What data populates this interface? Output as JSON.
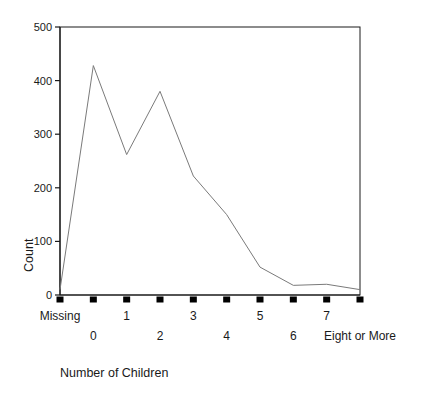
{
  "chart_data": {
    "type": "line",
    "title": "",
    "xlabel": "Number of Children",
    "ylabel": "Count",
    "categories": [
      "Missing",
      "0",
      "1",
      "2",
      "3",
      "4",
      "5",
      "6",
      "7",
      "Eight or More"
    ],
    "values": [
      10,
      428,
      262,
      380,
      222,
      150,
      52,
      18,
      20,
      10
    ],
    "series": [
      {
        "name": "Count",
        "values": [
          10,
          428,
          262,
          380,
          222,
          150,
          52,
          18,
          20,
          10
        ]
      }
    ],
    "ylim": [
      0,
      500
    ],
    "yticks": [
      0,
      100,
      200,
      300,
      400,
      500
    ],
    "ytick_labels": [
      "0",
      "100",
      "200",
      "300",
      "400",
      "500"
    ],
    "grid": false,
    "legend": "none",
    "line_color": "#7a7a7a",
    "axis_color": "#1a1a1a",
    "marker_color": "#000000",
    "background_color": "#ffffff"
  },
  "axes": {
    "y_title": "Count",
    "x_title": "Number of Children"
  },
  "x_labels_row_top": [
    "Missing",
    "1",
    "3",
    "5",
    "7"
  ],
  "x_labels_row_bottom": [
    "0",
    "2",
    "4",
    "6",
    "Eight or More"
  ]
}
